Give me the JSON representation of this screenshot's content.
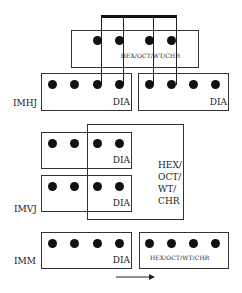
{
  "diagram": {
    "top_box": {
      "label": "HEX/OCT/WT/CHR"
    },
    "rows": [
      {
        "name": "IMHJ",
        "left_box_label": "DIA",
        "right_box_label": "DIA"
      },
      {
        "name": "IMVJ",
        "top_box_label": "DIA",
        "bottom_box_label": "DIA",
        "overlay_label_lines": [
          "HEX/",
          "OCT/",
          "WT/",
          "CHR"
        ]
      },
      {
        "name": "IMM",
        "left_box_label": "DIA",
        "right_box_label": "HEX/OCT/WT/CHR"
      }
    ],
    "arrow": {
      "direction": "right"
    },
    "colors": {
      "stroke": "#333333",
      "dot": "#111111",
      "background": "#ffffff"
    }
  }
}
